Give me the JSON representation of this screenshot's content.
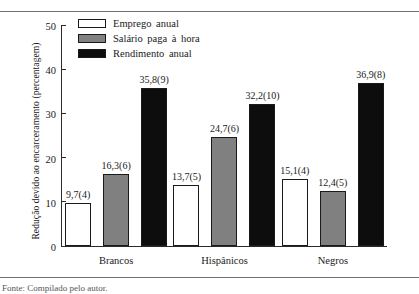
{
  "chart_data": {
    "type": "bar",
    "title": "",
    "xlabel": "",
    "ylabel": "Redução devido ao encarceramento (percentagem)",
    "ylim": [
      0,
      50
    ],
    "yticks": [
      0,
      10,
      20,
      30,
      40,
      50
    ],
    "grid": false,
    "legend_position": "top-left",
    "categories": [
      "Brancos",
      "Hispânicos",
      "Negros"
    ],
    "series": [
      {
        "name": "Emprego anual",
        "color": "#ffffff",
        "values": [
          9.7,
          13.7,
          15.1
        ],
        "labels": [
          "9,7(4)",
          "13,7(5)",
          "15,1(4)"
        ]
      },
      {
        "name": "Salário paga à hora",
        "color": "#808080",
        "values": [
          16.3,
          24.7,
          12.4
        ],
        "labels": [
          "16,3(6)",
          "24,7(6)",
          "12,4(5)"
        ]
      },
      {
        "name": "Rendimento anual",
        "color": "#0d0d0d",
        "values": [
          35.8,
          32.2,
          36.9
        ],
        "labels": [
          "35,8(9)",
          "32,2(10)",
          "36,9(8)"
        ]
      }
    ]
  },
  "caption": {
    "text": "Fonte: Compilado pelo autor."
  }
}
